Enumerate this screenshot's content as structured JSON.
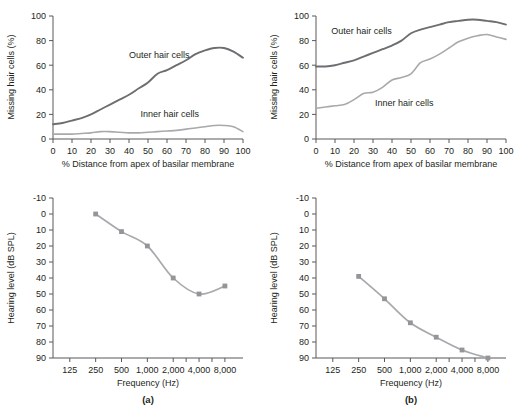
{
  "figure": {
    "panel_a_label": "(a)",
    "panel_b_label": "(b)"
  },
  "chart_data": [
    {
      "id": "cochleogram_a",
      "type": "line",
      "panel": "(a)",
      "title": "",
      "xlabel": "% Distance from apex of basilar membrane",
      "ylabel": "Missing hair cells (%)",
      "xlim": [
        0,
        100
      ],
      "ylim": [
        0,
        100
      ],
      "xticks": [
        0,
        10,
        20,
        30,
        40,
        50,
        60,
        70,
        80,
        90,
        100
      ],
      "xticklabels": [
        "0",
        "10",
        "20",
        "30",
        "40",
        "50",
        "60",
        "70",
        "80",
        "90",
        "100"
      ],
      "yticks": [
        0,
        20,
        40,
        60,
        80,
        100
      ],
      "yticklabels": [
        "0",
        "20",
        "40",
        "60",
        "80",
        "100"
      ],
      "grid": false,
      "legend_position": "inline-annotations",
      "series": [
        {
          "name": "Outer hair cells",
          "color": "#6d6e71",
          "label_x": 40,
          "label_y": 66,
          "x": [
            0,
            5,
            10,
            15,
            20,
            25,
            30,
            35,
            40,
            45,
            50,
            55,
            60,
            65,
            70,
            75,
            80,
            85,
            90,
            95,
            100
          ],
          "values": [
            12,
            13,
            15,
            17,
            20,
            24,
            28,
            32,
            36,
            41,
            46,
            53,
            56,
            60,
            64,
            69,
            72,
            74,
            74,
            71,
            66
          ]
        },
        {
          "name": "Inner hair cells",
          "color": "#a7a9ac",
          "label_x": 46,
          "label_y": 18,
          "x": [
            0,
            5,
            10,
            15,
            20,
            25,
            30,
            35,
            40,
            45,
            50,
            55,
            60,
            65,
            70,
            75,
            80,
            85,
            90,
            95,
            100
          ],
          "values": [
            4,
            4,
            4,
            4.5,
            5,
            6,
            6,
            5.5,
            5,
            5,
            5.5,
            6,
            6.5,
            7,
            8,
            9,
            10,
            11,
            11,
            10,
            6
          ]
        }
      ]
    },
    {
      "id": "cochleogram_b",
      "type": "line",
      "panel": "(b)",
      "title": "",
      "xlabel": "% Distance from apex of basilar membrane",
      "ylabel": "Missing hair cells (%)",
      "xlim": [
        0,
        100
      ],
      "ylim": [
        0,
        100
      ],
      "xticks": [
        0,
        10,
        20,
        30,
        40,
        50,
        60,
        70,
        80,
        90,
        100
      ],
      "xticklabels": [
        "0",
        "10",
        "20",
        "30",
        "40",
        "50",
        "60",
        "70",
        "80",
        "90",
        "100"
      ],
      "yticks": [
        0,
        20,
        40,
        60,
        80,
        100
      ],
      "yticklabels": [
        "0",
        "20",
        "40",
        "60",
        "80",
        "100"
      ],
      "grid": false,
      "legend_position": "inline-annotations",
      "series": [
        {
          "name": "Outer hair cells",
          "color": "#58595b",
          "label_x": 8,
          "label_y": 85,
          "x": [
            0,
            5,
            10,
            15,
            20,
            25,
            30,
            35,
            40,
            45,
            50,
            55,
            60,
            65,
            70,
            75,
            80,
            85,
            90,
            95,
            100
          ],
          "values": [
            59,
            59,
            60,
            62,
            64,
            67,
            70,
            73,
            76,
            80,
            86,
            89,
            91,
            93,
            95,
            96,
            97,
            97,
            96,
            95,
            93
          ]
        },
        {
          "name": "Inner hair cells",
          "color": "#a7a9ac",
          "label_x": 31,
          "label_y": 27,
          "x": [
            0,
            5,
            10,
            15,
            20,
            25,
            30,
            35,
            40,
            45,
            50,
            55,
            60,
            65,
            70,
            75,
            80,
            85,
            90,
            95,
            100
          ],
          "values": [
            25,
            26,
            27,
            28,
            32,
            37,
            38,
            42,
            48,
            50,
            53,
            62,
            65,
            69,
            74,
            79,
            82,
            84,
            85,
            83,
            81
          ]
        }
      ]
    },
    {
      "id": "audiogram_a",
      "type": "line",
      "panel": "(a)",
      "title": "",
      "xlabel": "Frequency (Hz)",
      "ylabel": "Hearing level (dB SPL)",
      "xticklabels": [
        "125",
        "250",
        "500",
        "1,000",
        "2,000",
        "4,000",
        "8,000"
      ],
      "yticks": [
        -10,
        0,
        10,
        20,
        30,
        40,
        50,
        60,
        70,
        80,
        90
      ],
      "yticklabels": [
        "-10",
        "0",
        "10",
        "20",
        "30",
        "40",
        "50",
        "60",
        "70",
        "80",
        "90"
      ],
      "ylim": [
        -10,
        90
      ],
      "y_axis_inverted": true,
      "grid": false,
      "legend_position": "none",
      "series": [
        {
          "name": "Hearing threshold",
          "color": "#a7a9ac",
          "marker": "square",
          "categories": [
            "250",
            "500",
            "1,000",
            "2,000",
            "4,000",
            "8,000"
          ],
          "values": [
            0,
            11,
            20,
            40,
            50,
            45
          ]
        }
      ]
    },
    {
      "id": "audiogram_b",
      "type": "line",
      "panel": "(b)",
      "title": "",
      "xlabel": "Frequency (Hz)",
      "ylabel": "Hearing level (dB SPL)",
      "xticklabels": [
        "125",
        "250",
        "500",
        "1,000",
        "2,000",
        "4,000",
        "8,000"
      ],
      "yticks": [
        -10,
        0,
        10,
        20,
        30,
        40,
        50,
        60,
        70,
        80,
        90
      ],
      "yticklabels": [
        "-10",
        "0",
        "10",
        "20",
        "30",
        "40",
        "50",
        "60",
        "70",
        "80",
        "90"
      ],
      "ylim": [
        -10,
        90
      ],
      "y_axis_inverted": true,
      "grid": false,
      "legend_position": "none",
      "series": [
        {
          "name": "Hearing threshold",
          "color": "#a7a9ac",
          "marker": "square",
          "categories": [
            "250",
            "500",
            "1,000",
            "2,000",
            "4,000",
            "8,000"
          ],
          "values": [
            39,
            53,
            68,
            77,
            85,
            90
          ]
        }
      ]
    }
  ]
}
